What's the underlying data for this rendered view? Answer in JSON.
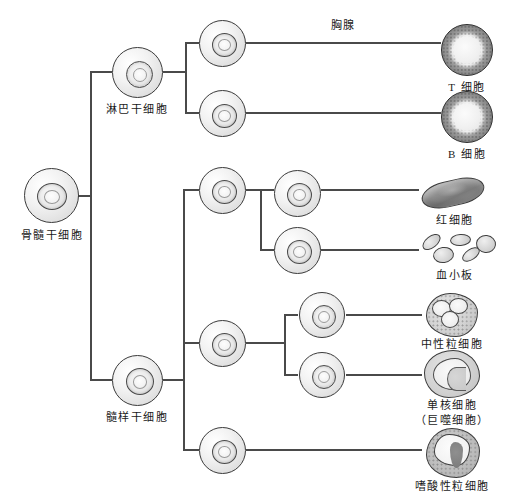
{
  "diagram": {
    "language": "zh",
    "colors": {
      "line": "#4a4a4a",
      "text": "#1a1a1a",
      "cell_outline": "#3a3a3a",
      "background": "#ffffff"
    }
  },
  "labels": {
    "bone_marrow_stem_cell": "骨髓干细胞",
    "lymphoid_stem_cell": "淋巴干细胞",
    "myeloid_stem_cell": "髓样干细胞",
    "thymus": "胸腺",
    "t_cell": "T 细胞",
    "b_cell": "B 细胞",
    "erythrocyte": "红细胞",
    "platelet": "血小板",
    "neutrophil": "中性粒细胞",
    "monocyte": "单核细胞",
    "macrophage": "（巨噬细胞）",
    "eosinophil": "嗜酸性粒细胞"
  },
  "nodes": [
    {
      "id": "bone-marrow-stem-cell",
      "label": "骨髓干细胞",
      "type": "stem-cell",
      "x": 52,
      "y": 196
    },
    {
      "id": "lymphoid-stem-cell",
      "label": "淋巴干细胞",
      "type": "stem-cell",
      "x": 137,
      "y": 72
    },
    {
      "id": "myeloid-stem-cell",
      "label": "髓样干细胞",
      "type": "stem-cell",
      "x": 137,
      "y": 380
    },
    {
      "id": "lymphoid-progenitor-t",
      "label": "",
      "type": "progenitor",
      "x": 222,
      "y": 43
    },
    {
      "id": "lymphoid-progenitor-b",
      "label": "",
      "type": "progenitor",
      "x": 222,
      "y": 113
    },
    {
      "id": "myeloid-progenitor-erythroid",
      "label": "",
      "type": "progenitor",
      "x": 222,
      "y": 190
    },
    {
      "id": "erythroid-precursor",
      "label": "",
      "type": "progenitor",
      "x": 297,
      "y": 193
    },
    {
      "id": "megakaryocyte-precursor",
      "label": "",
      "type": "progenitor",
      "x": 297,
      "y": 250
    },
    {
      "id": "myeloid-progenitor-granulocyte",
      "label": "",
      "type": "progenitor",
      "x": 222,
      "y": 343
    },
    {
      "id": "neutrophil-precursor",
      "label": "",
      "type": "progenitor",
      "x": 322,
      "y": 315
    },
    {
      "id": "monocyte-precursor",
      "label": "",
      "type": "progenitor",
      "x": 322,
      "y": 375
    },
    {
      "id": "eosinophil-precursor",
      "label": "",
      "type": "progenitor",
      "x": 222,
      "y": 450
    }
  ],
  "outputs": [
    {
      "id": "t-cell",
      "label": "T 细胞",
      "x": 467,
      "y": 50
    },
    {
      "id": "b-cell",
      "label": "B 细胞",
      "x": 467,
      "y": 117
    },
    {
      "id": "erythrocyte",
      "label": "红细胞",
      "x": 455,
      "y": 192
    },
    {
      "id": "platelet",
      "label": "血小板",
      "x": 455,
      "y": 248
    },
    {
      "id": "neutrophil",
      "label": "中性粒细胞",
      "x": 452,
      "y": 315
    },
    {
      "id": "monocyte",
      "label": "单核细胞",
      "sublabel": "（巨噬细胞）",
      "x": 452,
      "y": 375
    },
    {
      "id": "eosinophil",
      "label": "嗜酸性粒细胞",
      "x": 452,
      "y": 455
    }
  ],
  "edge_labels": [
    {
      "id": "thymus-edge-label",
      "text": "胸腺",
      "x": 343,
      "y": 24
    }
  ]
}
